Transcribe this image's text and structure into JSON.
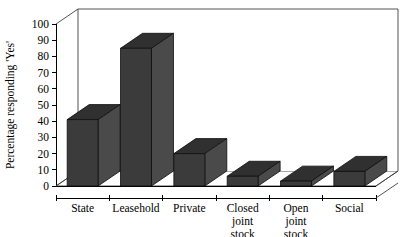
{
  "chart_data": {
    "type": "bar",
    "title": "",
    "subtitle": "",
    "xlabel": "",
    "ylabel": "Percentage responding 'Yes'",
    "categories": [
      "State",
      "Leasehold",
      "Private",
      "Closed joint stock",
      "Open joint stock",
      "Social"
    ],
    "category_lines": [
      [
        "State"
      ],
      [
        "Leasehold"
      ],
      [
        "Private"
      ],
      [
        "Closed",
        "joint",
        "stock"
      ],
      [
        "Open",
        "joint",
        "stock"
      ],
      [
        "Social"
      ]
    ],
    "values": [
      41,
      85,
      20,
      6,
      3,
      9
    ],
    "ylim": [
      0,
      100
    ],
    "ytick_labels": [
      "0",
      "10",
      "20",
      "30",
      "40",
      "50",
      "60",
      "70",
      "80",
      "90",
      "100"
    ],
    "ytick_values": [
      0,
      10,
      20,
      30,
      40,
      50,
      60,
      70,
      80,
      90,
      100
    ],
    "grid": false,
    "legend": null,
    "legend_position": "none",
    "style": "3d-bar",
    "annotations": []
  },
  "colors": {
    "bar_front": "#3b3b3b",
    "bar_side": "#4a4a4a",
    "bar_top": "#303030",
    "axis": "#000000",
    "frame": "#3f3f3f",
    "background": "#ffffff"
  }
}
